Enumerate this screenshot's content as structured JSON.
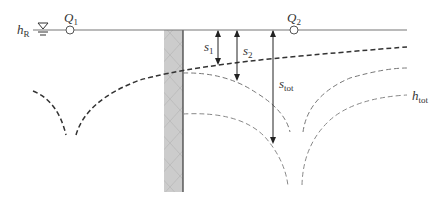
{
  "diagram": {
    "colors": {
      "line": "#555555",
      "wall_fill": "#cccccc",
      "wall_edge": "#444444",
      "dash_dark": "#333333",
      "dash_light": "#777777"
    },
    "labels": {
      "h_R": {
        "main": "h",
        "sub": "R"
      },
      "Q1": {
        "main": "Q",
        "sub": "1"
      },
      "Q2": {
        "main": "Q",
        "sub": "2"
      },
      "s1": {
        "main": "s",
        "sub": "1"
      },
      "s2": {
        "main": "s",
        "sub": "2"
      },
      "s_tot": {
        "main": "s",
        "sub": "tot"
      },
      "h_tot": {
        "main": "h",
        "sub": "tot"
      }
    },
    "elements": [
      "water-table-line",
      "water-level-symbol",
      "well-Q1",
      "well-Q2",
      "sheet-pile-wall",
      "drawdown-curve-Q1-mirror",
      "drawdown-curve-Q2",
      "drawdown-curve-total",
      "arrow-s1",
      "arrow-s2",
      "arrow-s-tot"
    ]
  }
}
